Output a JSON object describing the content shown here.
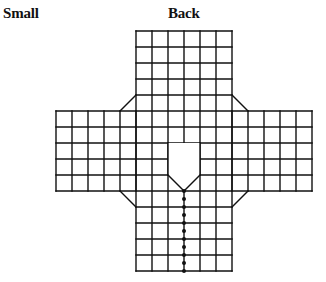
{
  "size_label": "Small",
  "view_label": "Back",
  "pattern": {
    "description": "Knitting/sewing pattern chart of a garment back with sleeves",
    "grid": {
      "body_columns": 6,
      "sleeve_columns_each_side": 4,
      "upper_body_rows": 4,
      "shoulder_rows": 1,
      "sleeve_rows": 5,
      "lower_body_rows": 5
    },
    "features": {
      "neck_cutout": "V-neck opening at center",
      "center_line": "dotted (buttons/seam) from neck point to hem",
      "shoulder_shaping": "diagonal bevels at underarm and shoulders"
    },
    "line_color": "#111111",
    "background_color": "#ffffff"
  }
}
